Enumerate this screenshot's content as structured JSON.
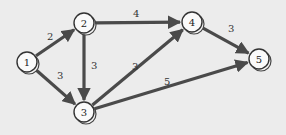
{
  "diagram": {
    "type": "directed-weighted-graph",
    "background": "#ececec",
    "edge_color": "#4a4a4a",
    "nodes": [
      {
        "id": "1",
        "label": "1",
        "x": 27,
        "y": 62
      },
      {
        "id": "2",
        "label": "2",
        "x": 84,
        "y": 23
      },
      {
        "id": "3",
        "label": "3",
        "x": 84,
        "y": 112
      },
      {
        "id": "4",
        "label": "4",
        "x": 192,
        "y": 22
      },
      {
        "id": "5",
        "label": "5",
        "x": 259,
        "y": 59
      }
    ],
    "edges": [
      {
        "from": "1",
        "to": "2",
        "weight": "2",
        "label_x": 47,
        "label_y": 40
      },
      {
        "from": "1",
        "to": "3",
        "weight": "3",
        "label_x": 57,
        "label_y": 79
      },
      {
        "from": "2",
        "to": "3",
        "weight": "3",
        "label_x": 91,
        "label_y": 69
      },
      {
        "from": "2",
        "to": "4",
        "weight": "4",
        "label_x": 133,
        "label_y": 17
      },
      {
        "from": "3",
        "to": "4",
        "weight": "3",
        "label_x": 132,
        "label_y": 70
      },
      {
        "from": "3",
        "to": "5",
        "weight": "5",
        "label_x": 164,
        "label_y": 85
      },
      {
        "from": "4",
        "to": "5",
        "weight": "3",
        "label_x": 228,
        "label_y": 32
      }
    ]
  }
}
